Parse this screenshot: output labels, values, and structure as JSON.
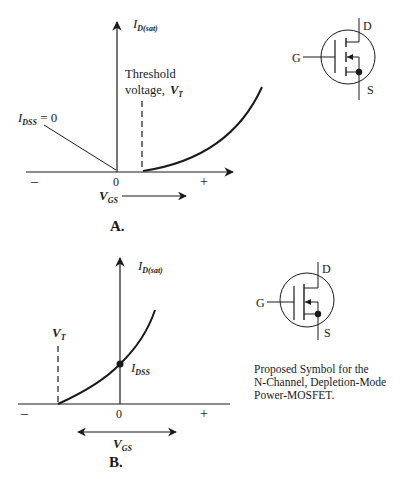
{
  "figure_a": {
    "panel_label": "A.",
    "y_axis_label": {
      "main": "I",
      "sub": "D(sat)"
    },
    "x_axis_label": {
      "main": "V",
      "sub": "GS"
    },
    "x_ticks": {
      "minus": "–",
      "zero": "0",
      "plus": "+"
    },
    "threshold_label_line1": "Threshold",
    "threshold_label_line2": "voltage,",
    "threshold_symbol": {
      "main": "V",
      "sub": "T"
    },
    "idss_label": {
      "main": "I",
      "sub": "DSS",
      "suffix": " = 0"
    },
    "description": "Enhancement-mode transfer characteristic: drain current zero below V_T, rises for V_GS > V_T"
  },
  "figure_b": {
    "panel_label": "B.",
    "y_axis_label": {
      "main": "I",
      "sub": "D(sat)"
    },
    "x_axis_label": {
      "main": "V",
      "sub": "GS"
    },
    "x_ticks": {
      "minus": "–",
      "zero": "0",
      "plus": "+"
    },
    "vt_label": {
      "main": "V",
      "sub": "T"
    },
    "idss_label": {
      "main": "I",
      "sub": "DSS"
    },
    "description": "Depletion-mode transfer characteristic: current flows at V_GS = 0 (I_DSS), cuts off at negative V_T"
  },
  "symbol_a": {
    "gate": "G",
    "drain": "D",
    "source": "S"
  },
  "symbol_b": {
    "gate": "G",
    "drain": "D",
    "source": "S"
  },
  "caption": {
    "line1": "Proposed Symbol for the",
    "line2": "N-Channel, Depletion-Mode",
    "line3": "Power-MOSFET."
  },
  "colors": {
    "ink": "#1a1a1a",
    "background": "#ffffff"
  }
}
